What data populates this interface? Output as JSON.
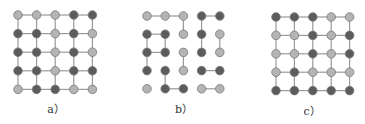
{
  "colors": {
    "light": "#b4b4b4",
    "dark": "#5c5c5c",
    "stroke": "#7a7a7a",
    "edge": "#9a9a9a"
  },
  "panels": [
    {
      "label": "a）",
      "origin": [
        18,
        15
      ],
      "spacing": 18.6,
      "caption_pos": [
        36,
        100
      ],
      "grid": [
        [
          "L",
          "L",
          "L",
          "D",
          "D"
        ],
        [
          "D",
          "D",
          "L",
          "D",
          "L"
        ],
        [
          "D",
          "D",
          "L",
          "D",
          "L"
        ],
        [
          "D",
          "D",
          "L",
          "D",
          "D"
        ],
        [
          "L",
          "D",
          "D",
          "L",
          "L"
        ]
      ],
      "edges": "full"
    },
    {
      "label": "b）",
      "origin": [
        147,
        16
      ],
      "spacing": 18.2,
      "caption_pos": [
        164,
        100
      ],
      "grid": [
        [
          "L",
          "L",
          "L",
          "D",
          "D"
        ],
        [
          "D",
          "D",
          "L",
          "D",
          "L"
        ],
        [
          "D",
          "D",
          "L",
          "D",
          "L"
        ],
        [
          "D",
          "D",
          "L",
          "D",
          "D"
        ],
        [
          "L",
          "D",
          "D",
          "L",
          "L"
        ]
      ],
      "edges": [
        [
          [
            0,
            0
          ],
          [
            0,
            1
          ]
        ],
        [
          [
            0,
            1
          ],
          [
            0,
            2
          ]
        ],
        [
          [
            0,
            2
          ],
          [
            1,
            2
          ]
        ],
        [
          [
            0,
            3
          ],
          [
            0,
            4
          ]
        ],
        [
          [
            1,
            0
          ],
          [
            1,
            1
          ]
        ],
        [
          [
            1,
            0
          ],
          [
            2,
            0
          ]
        ],
        [
          [
            1,
            1
          ],
          [
            2,
            1
          ]
        ],
        [
          [
            1,
            3
          ],
          [
            2,
            3
          ]
        ],
        [
          [
            0,
            3
          ],
          [
            1,
            3
          ]
        ],
        [
          [
            1,
            4
          ],
          [
            2,
            4
          ]
        ],
        [
          [
            2,
            2
          ],
          [
            3,
            2
          ]
        ],
        [
          [
            2,
            0
          ],
          [
            2,
            1
          ]
        ],
        [
          [
            2,
            0
          ],
          [
            3,
            0
          ]
        ],
        [
          [
            3,
            3
          ],
          [
            3,
            4
          ]
        ],
        [
          [
            3,
            1
          ],
          [
            4,
            1
          ]
        ],
        [
          [
            4,
            1
          ],
          [
            4,
            2
          ]
        ],
        [
          [
            4,
            3
          ],
          [
            4,
            4
          ]
        ]
      ]
    },
    {
      "label": "c）",
      "origin": [
        276,
        17
      ],
      "spacing": 18.4,
      "caption_pos": [
        292,
        102
      ],
      "grid": [
        [
          "D",
          "D",
          "D",
          "L",
          "L"
        ],
        [
          "L",
          "L",
          "D",
          "L",
          "D"
        ],
        [
          "L",
          "L",
          "D",
          "L",
          "D"
        ],
        [
          "L",
          "D",
          "L",
          "L",
          "L"
        ],
        [
          "D",
          "D",
          "D",
          "D",
          "D"
        ]
      ],
      "edges": "full"
    }
  ]
}
